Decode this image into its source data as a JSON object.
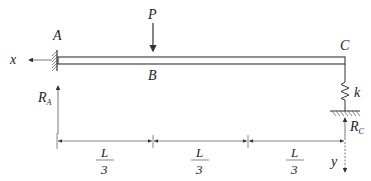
{
  "diagram": {
    "type": "beam-structure",
    "colors": {
      "line": "#333333",
      "dim": "#555555",
      "background": "#ffffff"
    },
    "nodes": {
      "A": {
        "label": "A"
      },
      "B": {
        "label": "B"
      },
      "C": {
        "label": "C"
      }
    },
    "load": {
      "label": "P"
    },
    "spring": {
      "label": "k"
    },
    "reactions": {
      "RA": {
        "main": "R",
        "sub": "A"
      },
      "RC": {
        "main": "R",
        "sub": "C"
      }
    },
    "axes": {
      "x": "x",
      "y": "y"
    },
    "dimensions": [
      {
        "num": "L",
        "den": "3"
      },
      {
        "num": "L",
        "den": "3"
      },
      {
        "num": "L",
        "den": "3"
      }
    ]
  }
}
